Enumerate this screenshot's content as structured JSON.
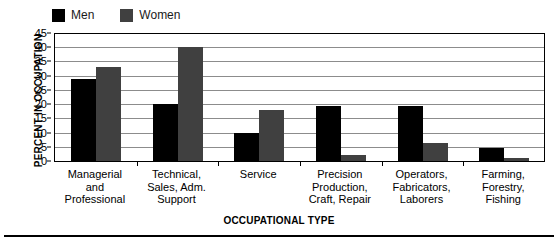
{
  "chart_data": {
    "type": "bar",
    "title": "",
    "subtitle": "",
    "xlabel": "OCCUPATIONAL TYPE",
    "ylabel": "PERCENT IN OCCUPATION",
    "ylim": [
      0,
      45
    ],
    "ytick_step": 5,
    "yticks": [
      45,
      40,
      35,
      30,
      25,
      20,
      15,
      10,
      5,
      0
    ],
    "grid": true,
    "legend_position": "top-left",
    "categories": [
      "Managerial and Professional",
      "Technical, Sales, Adm. Support",
      "Service",
      "Precision Production, Craft, Repair",
      "Operators, Fabricators, Laborers",
      "Farming, Forestry, Fishing"
    ],
    "category_lines": [
      [
        "Managerial",
        "and",
        "Professional"
      ],
      [
        "Technical,",
        "Sales, Adm.",
        "Support"
      ],
      [
        "Service"
      ],
      [
        "Precision",
        "Production,",
        "Craft, Repair"
      ],
      [
        "Operators,",
        "Fabricators,",
        "Laborers"
      ],
      [
        "Farming,",
        "Forestry,",
        "Fishing"
      ]
    ],
    "series": [
      {
        "name": "Men",
        "color": "#000000",
        "values": [
          29,
          20,
          10,
          19.5,
          19.5,
          4.5
        ]
      },
      {
        "name": "Women",
        "color": "#404040",
        "values": [
          33,
          40,
          18,
          2,
          6.5,
          1
        ]
      }
    ]
  },
  "legend": {
    "entries": [
      {
        "label": "Men",
        "color": "#000000"
      },
      {
        "label": "Women",
        "color": "#404040"
      }
    ]
  },
  "axes": {
    "y_title": "PERCENT IN OCCUPATION",
    "x_title": "OCCUPATIONAL TYPE",
    "y_tick_labels": [
      "45",
      "40",
      "35",
      "30",
      "25",
      "20",
      "15",
      "10",
      "5",
      "0"
    ]
  },
  "colors": {
    "men": "#000000",
    "women": "#404040",
    "grid": "#8c8c8c",
    "axis": "#000000",
    "background": "#ffffff"
  }
}
